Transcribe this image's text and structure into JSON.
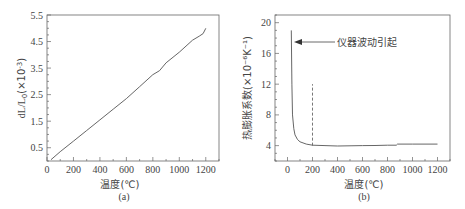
{
  "chart_data": [
    {
      "type": "line",
      "panel": "(a)",
      "title": "",
      "xlabel": "温度(℃)",
      "ylabel": "dL/L0(×10⁻³)",
      "xlim": [
        0,
        1300
      ],
      "ylim": [
        0,
        5.5
      ],
      "xticks": [
        0,
        200,
        400,
        600,
        800,
        1000,
        1200
      ],
      "yticks": [
        0.5,
        1.5,
        2.5,
        3.5,
        4.5,
        5.5
      ],
      "grid": false,
      "legend": null,
      "series": [
        {
          "name": "dL/L0",
          "x": [
            30,
            100,
            200,
            300,
            400,
            500,
            600,
            700,
            800,
            850,
            900,
            1000,
            1100,
            1150,
            1180,
            1200
          ],
          "y": [
            0.05,
            0.35,
            0.75,
            1.15,
            1.55,
            1.95,
            2.35,
            2.8,
            3.25,
            3.4,
            3.7,
            4.1,
            4.55,
            4.7,
            4.8,
            5.0
          ]
        }
      ]
    },
    {
      "type": "line",
      "panel": "(b)",
      "title": "",
      "xlabel": "温度(℃)",
      "ylabel": "热膨胀系数(×10⁻⁶K⁻¹)",
      "xlim": [
        -100,
        1300
      ],
      "ylim": [
        2,
        21
      ],
      "xticks": [
        0,
        200,
        400,
        600,
        800,
        1000,
        1200
      ],
      "yticks": [
        4,
        8,
        12,
        16,
        20
      ],
      "grid": false,
      "legend": null,
      "annotations": [
        {
          "text": "仪器波动引起",
          "arrow_to": [
            40,
            17.5
          ]
        },
        {
          "type": "vline-dashed",
          "x": 200,
          "y_range": [
            4,
            12
          ]
        }
      ],
      "series": [
        {
          "name": "CTE",
          "x": [
            30,
            35,
            40,
            50,
            60,
            80,
            100,
            150,
            200,
            300,
            400,
            500,
            600,
            700,
            800,
            870,
            880,
            900,
            1000,
            1100,
            1200
          ],
          "y": [
            19.0,
            12.0,
            8.0,
            6.2,
            5.4,
            4.8,
            4.5,
            4.2,
            4.05,
            4.0,
            3.95,
            3.98,
            4.0,
            4.02,
            4.05,
            4.05,
            4.2,
            4.2,
            4.2,
            4.2,
            4.2
          ]
        }
      ]
    }
  ],
  "panels": {
    "a": {
      "label": "(a)",
      "xlabel": "温度(℃)",
      "ylabel_main": "dL/L",
      "ylabel_sub": "0",
      "ylabel_unit": "(×10",
      "ylabel_exp": "-3",
      "ylabel_close": ")",
      "xtick_labels": [
        "0",
        "200",
        "400",
        "600",
        "800",
        "1000",
        "1200"
      ],
      "ytick_labels": [
        "0.5",
        "1.5",
        "2.5",
        "3.5",
        "4.5",
        "5.5"
      ]
    },
    "b": {
      "label": "(b)",
      "xlabel": "温度(℃)",
      "ylabel": "热膨胀系数(×10⁻⁶K⁻¹)",
      "annotation": "仪器波动引起",
      "xtick_labels": [
        "0",
        "200",
        "400",
        "600",
        "800",
        "1000",
        "1200"
      ],
      "ytick_labels": [
        "4",
        "8",
        "12",
        "16",
        "20"
      ]
    }
  }
}
